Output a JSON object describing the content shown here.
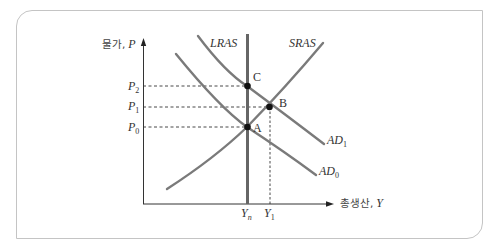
{
  "figure": {
    "y_axis": {
      "label_korean": "물가,",
      "label_var": "P",
      "ticks": [
        {
          "base": "P",
          "sub": "2"
        },
        {
          "base": "P",
          "sub": "1"
        },
        {
          "base": "P",
          "sub": "0"
        }
      ]
    },
    "x_axis": {
      "label_korean": "총생산,",
      "label_var": "Y",
      "ticks": [
        {
          "base": "Y",
          "sub": "n"
        },
        {
          "base": "Y",
          "sub": "1"
        }
      ]
    },
    "curves": {
      "lras": "LRAS",
      "sras": "SRAS",
      "ad1": {
        "base": "AD",
        "sub": "1"
      },
      "ad0": {
        "base": "AD",
        "sub": "0"
      }
    },
    "points": {
      "a": "A",
      "b": "B",
      "c": "C"
    },
    "colors": {
      "curve": "#7a7a7a",
      "lras": "#666666",
      "axis": "#333333",
      "point": "#111111",
      "border": "#c4c4c4"
    }
  }
}
